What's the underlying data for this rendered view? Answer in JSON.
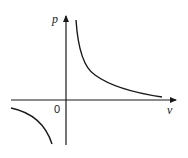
{
  "diagram": {
    "y_axis_label": "p",
    "x_axis_label": "v",
    "origin_label": "0",
    "curve_color": "#1a1a1a",
    "axis_color": "#1a1a1a"
  }
}
